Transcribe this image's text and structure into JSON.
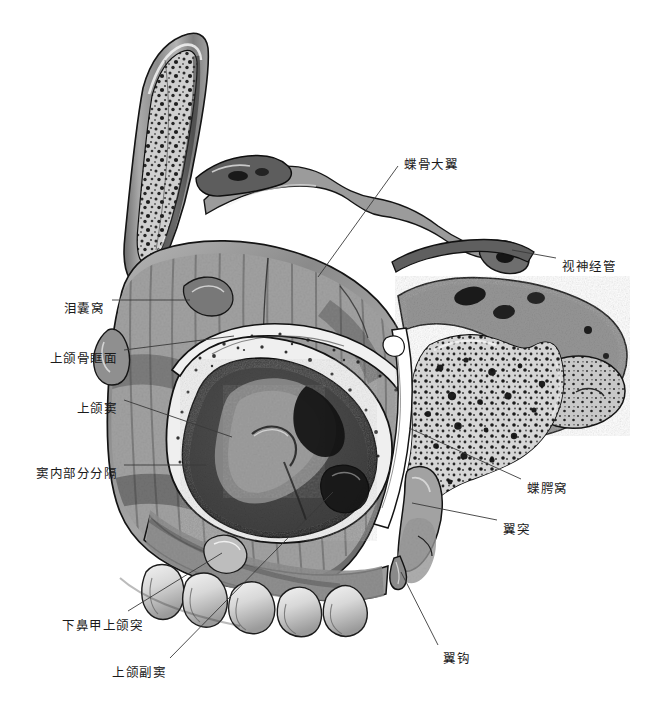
{
  "figure": {
    "type": "anatomical-illustration",
    "style": "grayscale halftone medical drawing",
    "background_color": "#ffffff",
    "ink_color": "#1a1a1a",
    "leader_line_color": "#3a3a3a"
  },
  "labels": [
    {
      "id": "greater-wing-of-sphenoid",
      "text": "蝶骨大翼",
      "align": "left",
      "text_x": 404,
      "text_y": 159,
      "leader": [
        [
          398,
          166
        ],
        [
          318,
          277
        ]
      ]
    },
    {
      "id": "optic-canal",
      "text": "视神经管",
      "align": "left",
      "text_x": 562,
      "text_y": 261,
      "leader": [
        [
          556,
          258
        ],
        [
          512,
          250
        ]
      ]
    },
    {
      "id": "lacrimal-sac-fossa",
      "text": "泪囊窝",
      "align": "right",
      "text_x": 104,
      "text_y": 303,
      "leader": [
        [
          112,
          300
        ],
        [
          190,
          300
        ]
      ]
    },
    {
      "id": "orbital-surface-of-maxilla",
      "text": "上颌骨眶面",
      "align": "right",
      "text_x": 117,
      "text_y": 353,
      "leader": [
        [
          124,
          350
        ],
        [
          234,
          336
        ]
      ]
    },
    {
      "id": "maxillary-sinus",
      "text": "上颌窦",
      "align": "right",
      "text_x": 117,
      "text_y": 403,
      "leader": [
        [
          124,
          400
        ],
        [
          232,
          437
        ]
      ]
    },
    {
      "id": "partial-septum-in-sinus",
      "text": "窦内部分分隔",
      "align": "right",
      "text_x": 117,
      "text_y": 468,
      "leader": [
        [
          124,
          465
        ],
        [
          206,
          465
        ]
      ]
    },
    {
      "id": "maxillary-process-of-inferior-concha",
      "text": "下鼻甲上颌突",
      "align": "left",
      "text_x": 62,
      "text_y": 620,
      "leader": [
        [
          128,
          611
        ],
        [
          222,
          553
        ]
      ]
    },
    {
      "id": "accessory-maxillary-sinus",
      "text": "上颌副窦",
      "align": "left",
      "text_x": 112,
      "text_y": 667,
      "leader": [
        [
          170,
          658
        ],
        [
          333,
          492
        ]
      ]
    },
    {
      "id": "pterygopalatine-fossa",
      "text": "蝶腭窝",
      "align": "left",
      "text_x": 527,
      "text_y": 483,
      "leader": [
        [
          521,
          479
        ],
        [
          409,
          428
        ]
      ]
    },
    {
      "id": "pterygoid-process",
      "text": "翼突",
      "align": "left",
      "text_x": 503,
      "text_y": 524,
      "leader": [
        [
          497,
          520
        ],
        [
          412,
          503
        ]
      ]
    },
    {
      "id": "pterygoid-hamulus",
      "text": "翼钩",
      "align": "left",
      "text_x": 443,
      "text_y": 653,
      "leader": [
        [
          438,
          645
        ],
        [
          401,
          572
        ]
      ]
    }
  ]
}
